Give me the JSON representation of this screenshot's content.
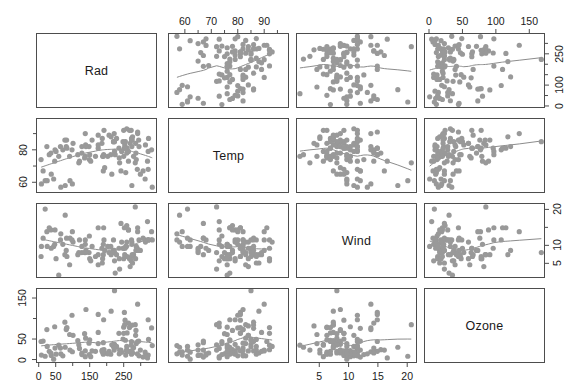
{
  "figure": {
    "type": "scatterplot-matrix",
    "variables": [
      "Rad",
      "Temp",
      "Wind",
      "Ozone"
    ],
    "point_color": "#999999",
    "line_color": "#8c8c8c",
    "panel_border_color": "#4d4d4d",
    "background": "#ffffff"
  },
  "diagonal": {
    "rad": "Rad",
    "temp": "Temp",
    "wind": "Wind",
    "ozone": "Ozone"
  },
  "axes": {
    "rad": {
      "name": "Rad",
      "min": -5,
      "max": 345,
      "major_ticks": [
        0,
        50,
        150,
        250
      ],
      "all_ticks": [
        0,
        50,
        100,
        150,
        200,
        250,
        300
      ],
      "labels": [
        "0",
        "50",
        "150",
        "250"
      ]
    },
    "temp": {
      "name": "Temp",
      "min": 54,
      "max": 99,
      "major_ticks": [
        60,
        70,
        80,
        90
      ],
      "all_ticks": [
        60,
        65,
        70,
        75,
        80,
        85,
        90,
        95
      ],
      "labels": [
        "60",
        "70",
        "80",
        "90"
      ]
    },
    "wind": {
      "name": "Wind",
      "min": 1.2,
      "max": 21.5,
      "major_ticks": [
        5,
        10,
        15,
        20
      ],
      "all_ticks": [
        5,
        10,
        15,
        20
      ],
      "labels": [
        "5",
        "10",
        "15",
        "20"
      ]
    },
    "ozone": {
      "name": "Ozone",
      "min": -6,
      "max": 172,
      "major_ticks": [
        0,
        50,
        100,
        150
      ],
      "all_ticks": [
        0,
        50,
        100,
        150
      ],
      "labels": [
        "0",
        "50",
        "100",
        "150"
      ]
    }
  },
  "axis_label_sets": {
    "top_temp": [
      "60",
      "70",
      "80",
      "90"
    ],
    "top_ozone": [
      "0",
      "50",
      "100",
      "150"
    ],
    "left_temp": [
      "60",
      "80"
    ],
    "left_ozone": [
      "0",
      "50",
      "150"
    ],
    "right_rad": [
      "0",
      "100",
      "250"
    ],
    "right_wind": [
      "5",
      "10",
      "20"
    ],
    "bottom_rad": [
      "0",
      "50",
      "150",
      "250"
    ],
    "bottom_wind": [
      "5",
      "10",
      "15",
      "20"
    ]
  },
  "chart_data": {
    "type": "scatter",
    "title": "",
    "subtitle": "",
    "layout": "4x4 scatterplot matrix (pairs plot) with variable names on the diagonal and LOWESS smoother curves in each off-diagonal panel",
    "grid": false,
    "legend": null,
    "variables": [
      {
        "key": "rad",
        "label": "Rad",
        "axis_label": "Rad",
        "range": [
          -5,
          345
        ],
        "ticks": [
          0,
          50,
          150,
          250
        ],
        "tick_labels": [
          "0",
          "50",
          "150",
          "250"
        ]
      },
      {
        "key": "temp",
        "label": "Temp",
        "axis_label": "Temp",
        "range": [
          54,
          99
        ],
        "ticks": [
          60,
          70,
          80,
          90
        ],
        "tick_labels": [
          "60",
          "70",
          "80",
          "90"
        ]
      },
      {
        "key": "wind",
        "label": "Wind",
        "axis_label": "Wind",
        "range": [
          1.2,
          21.5
        ],
        "ticks": [
          5,
          10,
          15,
          20
        ],
        "tick_labels": [
          "5",
          "10",
          "15",
          "20"
        ]
      },
      {
        "key": "ozone",
        "label": "Ozone",
        "axis_label": "Ozone",
        "range": [
          -6,
          172
        ],
        "ticks": [
          0,
          50,
          100,
          150
        ],
        "tick_labels": [
          "0",
          "50",
          "100",
          "150"
        ]
      }
    ],
    "n_observations": 111,
    "observations": [
      {
        "rad": 190,
        "temp": 67,
        "wind": 7.4,
        "ozone": 41
      },
      {
        "rad": 118,
        "temp": 72,
        "wind": 8.0,
        "ozone": 36
      },
      {
        "rad": 149,
        "temp": 74,
        "wind": 12.6,
        "ozone": 12
      },
      {
        "rad": 313,
        "temp": 62,
        "wind": 11.5,
        "ozone": 18
      },
      {
        "rad": 299,
        "temp": 65,
        "wind": 8.6,
        "ozone": 23
      },
      {
        "rad": 99,
        "temp": 59,
        "wind": 13.8,
        "ozone": 19
      },
      {
        "rad": 19,
        "temp": 61,
        "wind": 20.1,
        "ozone": 8
      },
      {
        "rad": 194,
        "temp": 69,
        "wind": 8.6,
        "ozone": 16
      },
      {
        "rad": 256,
        "temp": 66,
        "wind": 9.7,
        "ozone": 11
      },
      {
        "rad": 290,
        "temp": 68,
        "wind": 9.2,
        "ozone": 14
      },
      {
        "rad": 274,
        "temp": 58,
        "wind": 10.9,
        "ozone": 18
      },
      {
        "rad": 65,
        "temp": 57,
        "wind": 13.2,
        "ozone": 14
      },
      {
        "rad": 334,
        "temp": 57,
        "wind": 11.5,
        "ozone": 34
      },
      {
        "rad": 307,
        "temp": 67,
        "wind": 12.0,
        "ozone": 6
      },
      {
        "rad": 78,
        "temp": 58,
        "wind": 18.4,
        "ozone": 30
      },
      {
        "rad": 322,
        "temp": 68,
        "wind": 11.5,
        "ozone": 11
      },
      {
        "rad": 44,
        "temp": 62,
        "wind": 9.7,
        "ozone": 1
      },
      {
        "rad": 8,
        "temp": 59,
        "wind": 9.7,
        "ozone": 11
      },
      {
        "rad": 320,
        "temp": 73,
        "wind": 16.6,
        "ozone": 4
      },
      {
        "rad": 25,
        "temp": 61,
        "wind": 9.7,
        "ozone": 32
      },
      {
        "rad": 92,
        "temp": 61,
        "wind": 12.0,
        "ozone": 23
      },
      {
        "rad": 13,
        "temp": 67,
        "wind": 12.0,
        "ozone": 45
      },
      {
        "rad": 252,
        "temp": 81,
        "wind": 14.9,
        "ozone": 115
      },
      {
        "rad": 223,
        "temp": 79,
        "wind": 5.7,
        "ozone": 37
      },
      {
        "rad": 279,
        "temp": 76,
        "wind": 7.4,
        "ozone": 29
      },
      {
        "rad": 286,
        "temp": 78,
        "wind": 8.6,
        "ozone": 71
      },
      {
        "rad": 287,
        "temp": 74,
        "wind": 9.7,
        "ozone": 39
      },
      {
        "rad": 242,
        "temp": 67,
        "wind": 16.1,
        "ozone": 23
      },
      {
        "rad": 186,
        "temp": 84,
        "wind": 9.2,
        "ozone": 21
      },
      {
        "rad": 220,
        "temp": 85,
        "wind": 8.6,
        "ozone": 37
      },
      {
        "rad": 264,
        "temp": 79,
        "wind": 14.3,
        "ozone": 20
      },
      {
        "rad": 127,
        "temp": 82,
        "wind": 9.7,
        "ozone": 12
      },
      {
        "rad": 273,
        "temp": 87,
        "wind": 6.9,
        "ozone": 13
      },
      {
        "rad": 291,
        "temp": 90,
        "wind": 13.8,
        "ozone": 135
      },
      {
        "rad": 323,
        "temp": 87,
        "wind": 11.5,
        "ozone": 49
      },
      {
        "rad": 259,
        "temp": 93,
        "wind": 10.9,
        "ozone": 32
      },
      {
        "rad": 250,
        "temp": 92,
        "wind": 9.2,
        "ozone": 64
      },
      {
        "rad": 148,
        "temp": 82,
        "wind": 8.0,
        "ozone": 40
      },
      {
        "rad": 332,
        "temp": 80,
        "wind": 13.8,
        "ozone": 77
      },
      {
        "rad": 322,
        "temp": 79,
        "wind": 11.5,
        "ozone": 97
      },
      {
        "rad": 191,
        "temp": 77,
        "wind": 14.9,
        "ozone": 97
      },
      {
        "rad": 284,
        "temp": 72,
        "wind": 20.7,
        "ozone": 85
      },
      {
        "rad": 37,
        "temp": 65,
        "wind": 9.2,
        "ozone": 10
      },
      {
        "rad": 120,
        "temp": 73,
        "wind": 11.5,
        "ozone": 27
      },
      {
        "rad": 137,
        "temp": 76,
        "wind": 10.3,
        "ozone": 7
      },
      {
        "rad": 150,
        "temp": 77,
        "wind": 6.3,
        "ozone": 48
      },
      {
        "rad": 59,
        "temp": 76,
        "wind": 1.7,
        "ozone": 35
      },
      {
        "rad": 91,
        "temp": 76,
        "wind": 4.6,
        "ozone": 61
      },
      {
        "rad": 250,
        "temp": 76,
        "wind": 6.3,
        "ozone": 79
      },
      {
        "rad": 135,
        "temp": 75,
        "wind": 8.0,
        "ozone": 63
      },
      {
        "rad": 127,
        "temp": 78,
        "wind": 8.0,
        "ozone": 16
      },
      {
        "rad": 47,
        "temp": 73,
        "wind": 10.3,
        "ozone": 80
      },
      {
        "rad": 98,
        "temp": 80,
        "wind": 11.5,
        "ozone": 108
      },
      {
        "rad": 31,
        "temp": 77,
        "wind": 14.9,
        "ozone": 20
      },
      {
        "rad": 138,
        "temp": 83,
        "wind": 8.0,
        "ozone": 52
      },
      {
        "rad": 269,
        "temp": 84,
        "wind": 4.1,
        "ozone": 82
      },
      {
        "rad": 248,
        "temp": 85,
        "wind": 9.2,
        "ozone": 50
      },
      {
        "rad": 236,
        "temp": 81,
        "wind": 9.2,
        "ozone": 64
      },
      {
        "rad": 101,
        "temp": 84,
        "wind": 10.9,
        "ozone": 59
      },
      {
        "rad": 175,
        "temp": 83,
        "wind": 4.6,
        "ozone": 39
      },
      {
        "rad": 314,
        "temp": 83,
        "wind": 10.9,
        "ozone": 9
      },
      {
        "rad": 276,
        "temp": 88,
        "wind": 5.1,
        "ozone": 16
      },
      {
        "rad": 267,
        "temp": 92,
        "wind": 6.3,
        "ozone": 78
      },
      {
        "rad": 272,
        "temp": 92,
        "wind": 5.7,
        "ozone": 35
      },
      {
        "rad": 175,
        "temp": 89,
        "wind": 7.4,
        "ozone": 66
      },
      {
        "rad": 139,
        "temp": 82,
        "wind": 8.6,
        "ozone": 122
      },
      {
        "rad": 264,
        "temp": 73,
        "wind": 14.3,
        "ozone": 89
      },
      {
        "rad": 175,
        "temp": 81,
        "wind": 14.9,
        "ozone": 110
      },
      {
        "rad": 291,
        "temp": 91,
        "wind": 14.9,
        "ozone": 44
      },
      {
        "rad": 48,
        "temp": 80,
        "wind": 14.3,
        "ozone": 28
      },
      {
        "rad": 260,
        "temp": 81,
        "wind": 6.9,
        "ozone": 65
      },
      {
        "rad": 274,
        "temp": 82,
        "wind": 10.3,
        "ozone": 22
      },
      {
        "rad": 285,
        "temp": 84,
        "wind": 6.3,
        "ozone": 59
      },
      {
        "rad": 187,
        "temp": 87,
        "wind": 5.1,
        "ozone": 23
      },
      {
        "rad": 220,
        "temp": 85,
        "wind": 11.5,
        "ozone": 31
      },
      {
        "rad": 7,
        "temp": 74,
        "wind": 6.9,
        "ozone": 44
      },
      {
        "rad": 258,
        "temp": 81,
        "wind": 9.7,
        "ozone": 21
      },
      {
        "rad": 295,
        "temp": 82,
        "wind": 11.5,
        "ozone": 9
      },
      {
        "rad": 294,
        "temp": 86,
        "wind": 8.6,
        "ozone": 45
      },
      {
        "rad": 223,
        "temp": 85,
        "wind": 8.0,
        "ozone": 168
      },
      {
        "rad": 81,
        "temp": 82,
        "wind": 8.6,
        "ozone": 73
      },
      {
        "rad": 82,
        "temp": 86,
        "wind": 12.0,
        "ozone": 76
      },
      {
        "rad": 213,
        "temp": 88,
        "wind": 7.4,
        "ozone": 118
      },
      {
        "rad": 275,
        "temp": 86,
        "wind": 7.4,
        "ozone": 84
      },
      {
        "rad": 253,
        "temp": 83,
        "wind": 7.4,
        "ozone": 85
      },
      {
        "rad": 254,
        "temp": 81,
        "wind": 9.2,
        "ozone": 96
      },
      {
        "rad": 83,
        "temp": 81,
        "wind": 6.9,
        "ozone": 78
      },
      {
        "rad": 24,
        "temp": 82,
        "wind": 13.8,
        "ozone": 73
      },
      {
        "rad": 77,
        "temp": 86,
        "wind": 7.4,
        "ozone": 91
      },
      {
        "rad": 255,
        "temp": 85,
        "wind": 6.9,
        "ozone": 47
      },
      {
        "rad": 229,
        "temp": 87,
        "wind": 7.4,
        "ozone": 32
      },
      {
        "rad": 207,
        "temp": 89,
        "wind": 8.0,
        "ozone": 20
      },
      {
        "rad": 222,
        "temp": 90,
        "wind": 8.6,
        "ozone": 23
      },
      {
        "rad": 137,
        "temp": 90,
        "wind": 11.5,
        "ozone": 21
      },
      {
        "rad": 192,
        "temp": 92,
        "wind": 11.5,
        "ozone": 24
      },
      {
        "rad": 273,
        "temp": 86,
        "wind": 11.5,
        "ozone": 44
      },
      {
        "rad": 157,
        "temp": 86,
        "wind": 9.7,
        "ozone": 21
      },
      {
        "rad": 64,
        "temp": 82,
        "wind": 11.5,
        "ozone": 28
      },
      {
        "rad": 71,
        "temp": 80,
        "wind": 10.3,
        "ozone": 9
      },
      {
        "rad": 51,
        "temp": 79,
        "wind": 6.3,
        "ozone": 13
      },
      {
        "rad": 115,
        "temp": 77,
        "wind": 7.4,
        "ozone": 46
      },
      {
        "rad": 244,
        "temp": 79,
        "wind": 10.9,
        "ozone": 18
      },
      {
        "rad": 190,
        "temp": 76,
        "wind": 10.3,
        "ozone": 13
      },
      {
        "rad": 259,
        "temp": 78,
        "wind": 15.5,
        "ozone": 24
      },
      {
        "rad": 36,
        "temp": 78,
        "wind": 14.3,
        "ozone": 16
      },
      {
        "rad": 212,
        "temp": 77,
        "wind": 9.7,
        "ozone": 13
      },
      {
        "rad": 238,
        "temp": 72,
        "wind": 3.4,
        "ozone": 23
      },
      {
        "rad": 215,
        "temp": 65,
        "wind": 8.0,
        "ozone": 36
      },
      {
        "rad": 153,
        "temp": 73,
        "wind": 5.7,
        "ozone": 7
      },
      {
        "rad": 203,
        "temp": 76,
        "wind": 9.7,
        "ozone": 14
      },
      {
        "rad": 225,
        "temp": 77,
        "wind": 2.3,
        "ozone": 30
      },
      {
        "rad": 237,
        "temp": 75,
        "wind": 6.3,
        "ozone": 14
      },
      {
        "rad": 188,
        "temp": 76,
        "wind": 6.3,
        "ozone": 18
      },
      {
        "rad": 167,
        "temp": 76,
        "wind": 6.9,
        "ozone": 20
      }
    ],
    "smoothers": {
      "description": "LOWESS smoother curve drawn in every off-diagonal panel",
      "span": 0.666,
      "color": "#8c8c8c"
    }
  }
}
